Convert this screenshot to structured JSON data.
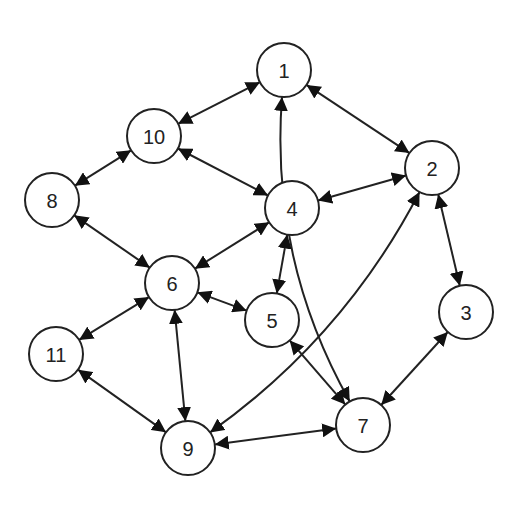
{
  "diagram": {
    "type": "directed-graph",
    "edge_style": "bidirectional-arrows",
    "colors": {
      "stroke": "#222222",
      "node_fill": "#ffffff",
      "background": "#ffffff"
    },
    "node_radius": 27,
    "nodes": [
      {
        "id": "1",
        "label": "1",
        "x": 284,
        "y": 70
      },
      {
        "id": "2",
        "label": "2",
        "x": 432,
        "y": 168
      },
      {
        "id": "3",
        "label": "3",
        "x": 466,
        "y": 312
      },
      {
        "id": "4",
        "label": "4",
        "x": 292,
        "y": 208
      },
      {
        "id": "5",
        "label": "5",
        "x": 272,
        "y": 320
      },
      {
        "id": "6",
        "label": "6",
        "x": 172,
        "y": 283
      },
      {
        "id": "7",
        "label": "7",
        "x": 363,
        "y": 425
      },
      {
        "id": "8",
        "label": "8",
        "x": 52,
        "y": 200
      },
      {
        "id": "9",
        "label": "9",
        "x": 188,
        "y": 448
      },
      {
        "id": "10",
        "label": "10",
        "x": 154,
        "y": 136
      },
      {
        "id": "11",
        "label": "11",
        "x": 56,
        "y": 354
      }
    ],
    "edges": [
      {
        "from": "1",
        "to": "10",
        "bidirectional": true
      },
      {
        "from": "1",
        "to": "2",
        "bidirectional": true
      },
      {
        "from": "1",
        "to": "7",
        "bidirectional": true,
        "curve": 55
      },
      {
        "from": "10",
        "to": "8",
        "bidirectional": true
      },
      {
        "from": "10",
        "to": "4",
        "bidirectional": true
      },
      {
        "from": "2",
        "to": "4",
        "bidirectional": true
      },
      {
        "from": "2",
        "to": "3",
        "bidirectional": true
      },
      {
        "from": "2",
        "to": "9",
        "bidirectional": true,
        "curve": -45
      },
      {
        "from": "4",
        "to": "6",
        "bidirectional": true
      },
      {
        "from": "4",
        "to": "5",
        "bidirectional": true
      },
      {
        "from": "8",
        "to": "6",
        "bidirectional": true
      },
      {
        "from": "6",
        "to": "5",
        "bidirectional": true
      },
      {
        "from": "6",
        "to": "11",
        "bidirectional": true
      },
      {
        "from": "6",
        "to": "9",
        "bidirectional": true
      },
      {
        "from": "11",
        "to": "9",
        "bidirectional": true
      },
      {
        "from": "5",
        "to": "7",
        "bidirectional": true
      },
      {
        "from": "3",
        "to": "7",
        "bidirectional": true
      },
      {
        "from": "9",
        "to": "7",
        "bidirectional": true
      }
    ]
  }
}
